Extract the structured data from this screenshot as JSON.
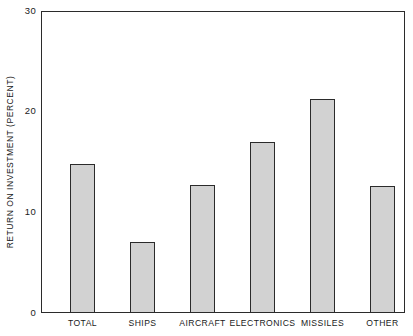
{
  "chart_data": {
    "type": "bar",
    "title": "",
    "subtitle": "",
    "xlabel": "",
    "ylabel": "RETURN ON INVESTMENT (PERCENT)",
    "categories": [
      "TOTAL",
      "SHIPS",
      "AIRCRAFT",
      "ELECTRONICS",
      "MISSILES",
      "OTHER"
    ],
    "values": [
      14.8,
      7.1,
      12.7,
      17.0,
      21.3,
      12.6
    ],
    "ylim": [
      0,
      30
    ],
    "yticks": [
      0,
      10,
      20,
      30
    ],
    "ytick_labels": [
      "0",
      "10",
      "20",
      "30"
    ],
    "grid": false,
    "legend": false,
    "legend_position": "none",
    "annotations": [],
    "bar_fill_color": "#d2d2d2",
    "bar_edge_color": "#2b2b2b",
    "axis_color": "#2b2b2b",
    "background_color": "#ffffff"
  }
}
